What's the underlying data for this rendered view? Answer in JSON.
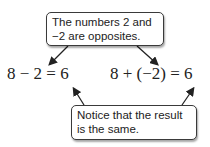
{
  "top_callout": {
    "line1": "The numbers 2 and",
    "line2": "−2 are opposites."
  },
  "equations": {
    "left": "8 − 2 = 6",
    "right": "8 + (−2) = 6"
  },
  "bottom_callout": {
    "line1": "Notice that the result",
    "line2": "is the same."
  },
  "colors": {
    "stroke": "#3a3a3a",
    "text": "#222222"
  }
}
